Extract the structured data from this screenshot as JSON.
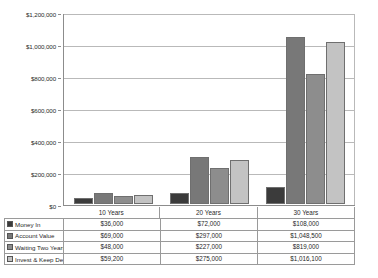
{
  "chart_data": {
    "type": "bar",
    "title": "",
    "xlabel": "",
    "ylabel": "",
    "categories": [
      "10 Years",
      "20 Years",
      "30 Years"
    ],
    "ylim": [
      0,
      1200000
    ],
    "ytick_labels": [
      "$1,200,000",
      "$1,000,000",
      "$800,000",
      "$600,000",
      "$400,000",
      "$200,000",
      "$0"
    ],
    "ytick_values": [
      1200000,
      1000000,
      800000,
      600000,
      400000,
      200000,
      0
    ],
    "grid": "horizontal",
    "legend_position": "table-below",
    "series": [
      {
        "name": "Money In",
        "color": "#3b3b3b",
        "values": [
          36000,
          72000,
          108000
        ],
        "labels": [
          "$36,000",
          "$72,000",
          "$108,000"
        ]
      },
      {
        "name": "Account Value",
        "color": "#787878",
        "values": [
          69000,
          297000,
          1048500
        ],
        "labels": [
          "$69,000",
          "$297,000",
          "$1,048,500"
        ]
      },
      {
        "name": "Waiting Two Years",
        "color": "#8d8d8d",
        "values": [
          48000,
          227000,
          819000
        ],
        "labels": [
          "$48,000",
          "$227,000",
          "$819,000"
        ]
      },
      {
        "name": "Invest & Keep Debt",
        "color": "#c3c3c3",
        "values": [
          59200,
          275000,
          1016100
        ],
        "labels": [
          "$59,200",
          "$275,000",
          "$1,016,100"
        ]
      }
    ]
  }
}
